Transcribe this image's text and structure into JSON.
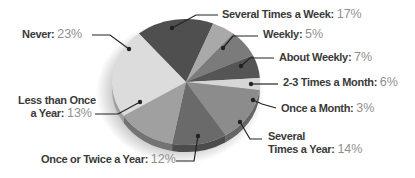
{
  "chart_data": {
    "type": "pie",
    "title": "",
    "style": "3d-tilted-grayscale",
    "slices": [
      {
        "label": "Several Times  a Week",
        "value": 17,
        "color": "#4f4f4f"
      },
      {
        "label": "Weekly",
        "value": 5,
        "color": "#a9a9a9"
      },
      {
        "label": "About Weekly",
        "value": 7,
        "color": "#7b7b7b"
      },
      {
        "label": "2-3 Times a Month",
        "value": 6,
        "color": "#555555"
      },
      {
        "label": "Once a Month",
        "value": 3,
        "color": "#d6d6d6"
      },
      {
        "label": "Several Times a Year",
        "value": 14,
        "color": "#8c8c8c"
      },
      {
        "label": "Once or Twice a Year",
        "value": 12,
        "color": "#6a6a6a"
      },
      {
        "label": "Less than Once a Year",
        "value": 13,
        "color": "#a0a0a0"
      },
      {
        "label": "Never",
        "value": 23,
        "color": "#dcdcdc"
      }
    ],
    "legend": "callout-labels"
  },
  "labels": {
    "never": {
      "name": "Never:",
      "pct": "23%"
    },
    "several_week": {
      "name": "Several Times  a Week:",
      "pct": "17%"
    },
    "weekly": {
      "name": "Weekly:",
      "pct": "5%"
    },
    "about_weekly": {
      "name": "About Weekly:",
      "pct": "7%"
    },
    "two_three_month": {
      "name": "2-3 Times a Month:",
      "pct": "6%"
    },
    "once_month": {
      "name": "Once a Month:",
      "pct": "3%"
    },
    "several_year_line1": "Several",
    "several_year": {
      "name": "Times a Year:",
      "pct": "14%"
    },
    "less_once_line1": "Less than Once",
    "less_once": {
      "name": "a Year:",
      "pct": "13%"
    },
    "once_twice_year": {
      "name": "Once or Twice a Year:",
      "pct": "12%"
    }
  }
}
